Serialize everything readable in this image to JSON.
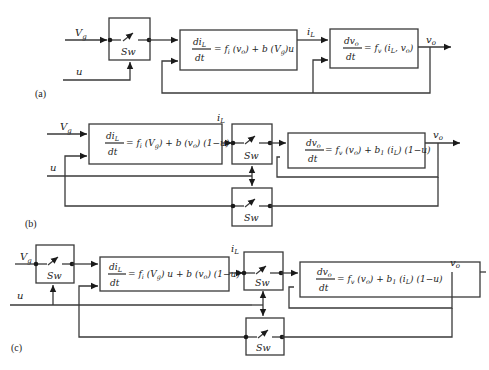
{
  "diagram": {
    "panels": [
      {
        "id": "a",
        "label": "(a)",
        "inputs": {
          "vg": "V",
          "vg_sub": "g",
          "u": "u"
        },
        "switches": [
          {
            "label": "Sw"
          }
        ],
        "block_current": {
          "num": "di",
          "num_sub": "L",
          "den": "dt",
          "rhs_parts": [
            "= f",
            "i",
            " (v",
            "o",
            ") + b (V",
            "g",
            ")u"
          ]
        },
        "signal_iL": {
          "main": "i",
          "sub": "L"
        },
        "block_voltage": {
          "num": "dv",
          "num_sub": "o",
          "den": "dt",
          "rhs_parts": [
            "= f",
            "v",
            " (i",
            "L",
            ", v",
            "o",
            ")"
          ]
        },
        "output": {
          "main": "v",
          "sub": "o"
        }
      },
      {
        "id": "b",
        "label": "(b)",
        "inputs": {
          "vg": "V",
          "vg_sub": "g",
          "u": "u"
        },
        "switches": [
          {
            "label": "Sw"
          },
          {
            "label": "Sw"
          }
        ],
        "block_current": {
          "num": "di",
          "num_sub": "L",
          "den": "dt",
          "rhs_parts": [
            "= f",
            "i",
            " (V",
            "g",
            ") + b (v",
            "o",
            ") (1−u)"
          ]
        },
        "signal_iL": {
          "main": "i",
          "sub": "L"
        },
        "block_voltage": {
          "num": "dv",
          "num_sub": "o",
          "den": "dt",
          "rhs_parts": [
            "= f",
            "v",
            " (v",
            "o",
            ") + b",
            "1",
            " (i",
            "L",
            ") (1−u)"
          ]
        },
        "output": {
          "main": "v",
          "sub": "o"
        }
      },
      {
        "id": "c",
        "label": "(c)",
        "inputs": {
          "vg": "V",
          "vg_sub": "g",
          "u": "u"
        },
        "switches": [
          {
            "label": "Sw"
          },
          {
            "label": "Sw"
          },
          {
            "label": "Sw"
          }
        ],
        "block_current": {
          "num": "di",
          "num_sub": "L",
          "den": "dt",
          "rhs_parts": [
            "= f",
            "i",
            " (V",
            "g",
            ") u + b (v",
            "o",
            ") (1−u)"
          ]
        },
        "signal_iL": {
          "main": "i",
          "sub": "L"
        },
        "block_voltage": {
          "num": "dv",
          "num_sub": "o",
          "den": "dt",
          "rhs_parts": [
            "= f",
            "v",
            " (v",
            "o",
            ") + b",
            "1",
            " (i",
            "L",
            ") (1−u)"
          ]
        },
        "output": {
          "main": "v",
          "sub": "o"
        }
      }
    ],
    "colors": {
      "line": "#3a3a3a",
      "background": "#ffffff"
    }
  }
}
